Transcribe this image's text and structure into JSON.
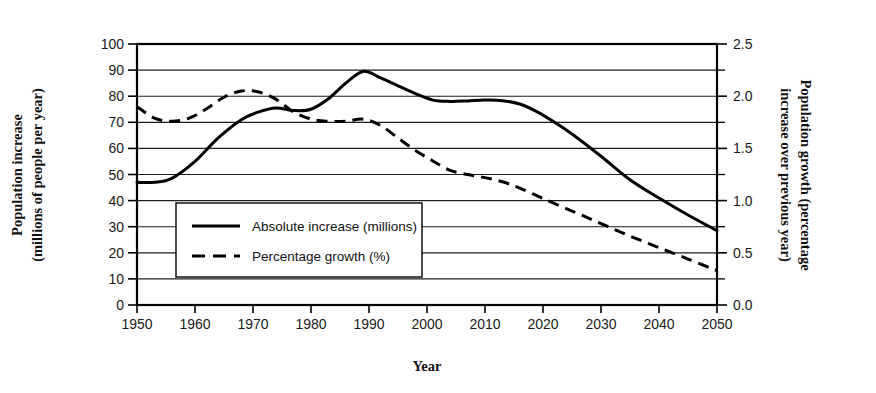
{
  "chart_data": {
    "type": "line",
    "title": "",
    "xlabel": "Year",
    "ylabel": "Population increase (millions of people per year)",
    "y2label": "Population growth (percentage increase over previous year)",
    "xlim": [
      1950,
      2050
    ],
    "ylim": [
      0,
      100
    ],
    "y2lim": [
      0.0,
      2.5
    ],
    "grid": true,
    "legend_position": "inside-lower-left",
    "x_ticks": [
      1950,
      1960,
      1970,
      1980,
      1990,
      2000,
      2010,
      2020,
      2030,
      2040,
      2050
    ],
    "x_tick_labels": [
      "1950",
      "1960",
      "1970",
      "1980",
      "1990",
      "2000",
      "2010",
      "2020",
      "2030",
      "2040",
      "2050"
    ],
    "y_ticks": [
      0,
      10,
      20,
      30,
      40,
      50,
      60,
      70,
      80,
      90,
      100
    ],
    "y_tick_labels": [
      "0",
      "10",
      "20",
      "30",
      "40",
      "50",
      "60",
      "70",
      "80",
      "90",
      "100"
    ],
    "y2_ticks": [
      0.0,
      0.5,
      1.0,
      1.5,
      2.0,
      2.5
    ],
    "y2_tick_labels": [
      "0.0",
      "0.5",
      "1.0",
      "1.5",
      "2.0",
      "2.5"
    ],
    "y2_minor_ticks": [
      0.25,
      0.75,
      1.25,
      1.75,
      2.25
    ],
    "series": [
      {
        "name": "Absolute increase (millions)",
        "axis": "left",
        "style": "solid",
        "x": [
          1950,
          1953,
          1956,
          1960,
          1964,
          1968,
          1971,
          1974,
          1977,
          1980,
          1983,
          1986,
          1989,
          1992,
          1995,
          1998,
          2001,
          2004,
          2007,
          2010,
          2013,
          2016,
          2019,
          2022,
          2025,
          2030,
          2035,
          2040,
          2045,
          2050
        ],
        "values": [
          47,
          47,
          48.5,
          55,
          64,
          71,
          74,
          75.5,
          74.5,
          75,
          79,
          85,
          89.5,
          87,
          84,
          81,
          78.5,
          78,
          78.2,
          78.5,
          78.3,
          77,
          74,
          70,
          65.5,
          57,
          48,
          41,
          34.5,
          28.5
        ]
      },
      {
        "name": "Percentage growth (%)",
        "axis": "right",
        "style": "dashed",
        "x": [
          1950,
          1953,
          1956,
          1959,
          1962,
          1965,
          1968,
          1971,
          1974,
          1977,
          1980,
          1983,
          1986,
          1989,
          1992,
          1995,
          1998,
          2001,
          2004,
          2007,
          2010,
          2013,
          2016,
          2020,
          2025,
          2030,
          2035,
          2040,
          2045,
          2050
        ],
        "values": [
          1.9,
          1.79,
          1.76,
          1.79,
          1.88,
          1.99,
          2.05,
          2.04,
          1.97,
          1.85,
          1.78,
          1.76,
          1.76,
          1.78,
          1.72,
          1.6,
          1.48,
          1.38,
          1.29,
          1.25,
          1.22,
          1.18,
          1.12,
          1.02,
          0.9,
          0.78,
          0.66,
          0.55,
          0.44,
          0.33
        ]
      }
    ],
    "legend_entries": [
      {
        "label": "Absolute increase (millions)",
        "style": "solid"
      },
      {
        "label": "Percentage growth (%)",
        "style": "dashed"
      }
    ]
  }
}
